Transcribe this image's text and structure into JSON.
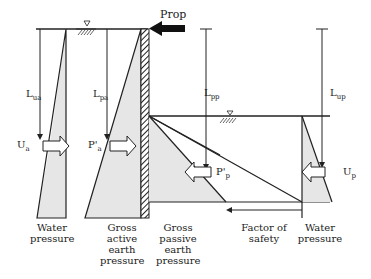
{
  "diagram": {
    "labels": {
      "prop": "Prop",
      "l_ua": "L",
      "l_ua_sub": "ua",
      "l_pa": "L",
      "l_pa_sub": "pa",
      "l_pp": "L",
      "l_pp_sub": "pp",
      "l_up": "L",
      "l_up_sub": "up",
      "u_a": "U",
      "u_a_sub": "a",
      "p_a": "P'",
      "p_a_sub": "a",
      "p_p": "P'",
      "p_p_sub": "p",
      "u_p": "U",
      "u_p_sub": "p"
    },
    "captions": [
      {
        "id": "water-pressure-left",
        "text": "Water\npressure"
      },
      {
        "id": "gross-active",
        "text": "Gross\nactive\nearth\npressure"
      },
      {
        "id": "gross-passive",
        "text": "Gross\npassive\nearth\npressure"
      },
      {
        "id": "factor-of-safety",
        "text": "Factor of\nsafety"
      },
      {
        "id": "water-pressure-right",
        "text": "Water\npressure"
      }
    ],
    "colors": {
      "line": "#222222",
      "fill": "#e6e6e6",
      "prop": "#111111"
    }
  }
}
